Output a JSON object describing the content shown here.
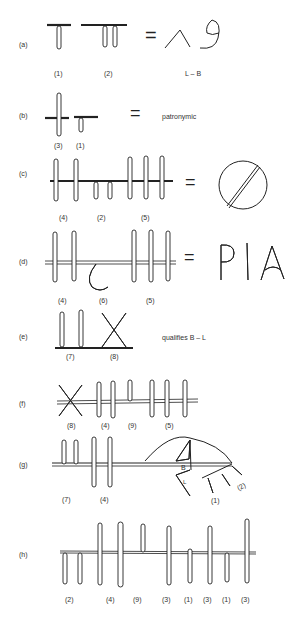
{
  "rows": [
    {
      "letter": "(a)",
      "labels": [
        "(1)",
        "(2)"
      ],
      "equals": "=",
      "result_caption": "L – B"
    },
    {
      "letter": "(b)",
      "labels": [
        "(3)",
        "(1)"
      ],
      "equals": "=",
      "result_text": "patronymic"
    },
    {
      "letter": "(c)",
      "labels": [
        "(4)",
        "(2)",
        "(5)"
      ],
      "equals": "="
    },
    {
      "letter": "(d)",
      "labels": [
        "(4)",
        "(6)",
        "(5)"
      ],
      "equals": "=",
      "result_text": "PIA"
    },
    {
      "letter": "(e)",
      "labels": [
        "(7)",
        "(8)"
      ],
      "result_text": "qualifies B – L"
    },
    {
      "letter": "(f)",
      "labels": [
        "(8)",
        "(4)",
        "(9)",
        "(5)"
      ]
    },
    {
      "letter": "(g)",
      "labels": [
        "(7)",
        "(4)",
        "(1)",
        "(2)"
      ],
      "figure_letters": [
        "B",
        "L"
      ]
    },
    {
      "letter": "(h)",
      "labels": [
        "(2)",
        "(4)",
        "(9)",
        "(3)",
        "(1)",
        "(3)",
        "(1)",
        "(3)"
      ]
    }
  ]
}
